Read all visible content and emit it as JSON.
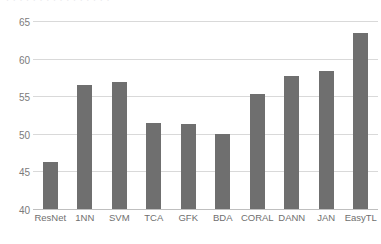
{
  "figure": {
    "top_strip_ghost_text": "· · · · · · · · · · · · · · · ·",
    "bar_color": "#6f6f6f",
    "gridline_color": "#d9d9d9",
    "axis_color": "#bfbfbf",
    "tick_label_color": "#7b7b7b",
    "background_color": "#ffffff"
  },
  "chart_data": {
    "type": "bar",
    "title": "",
    "subtitle": "",
    "xlabel": "",
    "ylabel": "",
    "categories": [
      "ResNet",
      "1NN",
      "SVM",
      "TCA",
      "GFK",
      "BDA",
      "CORAL",
      "DANN",
      "JAN",
      "EasyTL"
    ],
    "values": [
      46.2,
      56.5,
      57.0,
      51.4,
      51.3,
      50.0,
      55.3,
      57.7,
      58.5,
      63.5
    ],
    "ylim": [
      40,
      65
    ],
    "yticks": [
      40,
      45,
      50,
      55,
      60,
      65
    ],
    "ytick_labels": [
      "40",
      "45",
      "50",
      "55",
      "60",
      "65"
    ],
    "grid": true,
    "grid_axis": "y",
    "legend": false,
    "legend_entries": [],
    "annotations": []
  }
}
